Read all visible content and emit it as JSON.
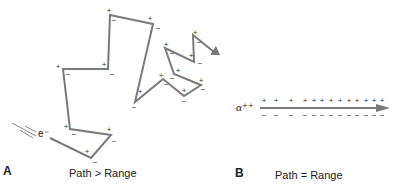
{
  "panel_a": {
    "letter": "A",
    "caption": "Path > Range",
    "particle": "e⁻",
    "path_points": [
      [
        50,
        138
      ],
      [
        91,
        158
      ],
      [
        111,
        135
      ],
      [
        70,
        129
      ],
      [
        63,
        69
      ],
      [
        108,
        69
      ],
      [
        110,
        15
      ],
      [
        153,
        24
      ],
      [
        135,
        102
      ],
      [
        163,
        79
      ],
      [
        184,
        96
      ],
      [
        201,
        85
      ],
      [
        174,
        74
      ],
      [
        165,
        48
      ],
      [
        194,
        62
      ],
      [
        193,
        35
      ],
      [
        214,
        52
      ]
    ],
    "arrow_tip": [
      220,
      55
    ],
    "ion_pairs": [
      {
        "plus": [
          87,
          151
        ],
        "minus": [
          95,
          162
        ]
      },
      {
        "plus": [
          109,
          129
        ],
        "minus": [
          114,
          141
        ]
      },
      {
        "plus": [
          66,
          126
        ],
        "minus": [
          74,
          134
        ]
      },
      {
        "plus": [
          58,
          66
        ],
        "minus": [
          68,
          74
        ]
      },
      {
        "plus": [
          104,
          64
        ],
        "minus": [
          112,
          74
        ]
      },
      {
        "plus": [
          109,
          10
        ],
        "minus": [
          114,
          20
        ]
      },
      {
        "plus": [
          150,
          18
        ],
        "minus": [
          158,
          28
        ]
      },
      {
        "plus": [
          140,
          91
        ],
        "minus": [
          134,
          107
        ]
      },
      {
        "plus": [
          161,
          75
        ],
        "minus": [
          166,
          84
        ]
      },
      {
        "plus": [
          184,
          90
        ],
        "minus": [
          184,
          101
        ]
      },
      {
        "plus": [
          201,
          80
        ],
        "minus": [
          203,
          89
        ]
      },
      {
        "plus": [
          178,
          70
        ],
        "minus": [
          172,
          78
        ]
      },
      {
        "plus": [
          166,
          44
        ],
        "minus": [
          172,
          53
        ]
      },
      {
        "plus": [
          191,
          55
        ],
        "minus": [
          200,
          63
        ]
      },
      {
        "plus": [
          195,
          32
        ],
        "minus": [
          199,
          42
        ]
      }
    ]
  },
  "panel_b": {
    "letter": "B",
    "caption": "Path = Range",
    "particle": "α⁺⁺",
    "arrow": {
      "x1": 260,
      "x2": 390,
      "y": 108
    },
    "plus_x": [
      264,
      276,
      291,
      305,
      314,
      322,
      331,
      340,
      349,
      357,
      366,
      374,
      382
    ],
    "minus_x": [
      264,
      276,
      291,
      305,
      314,
      322,
      331,
      340,
      349,
      357,
      366,
      374,
      382
    ]
  },
  "colors": {
    "line": "#7a7a7a",
    "text": "#222222"
  }
}
